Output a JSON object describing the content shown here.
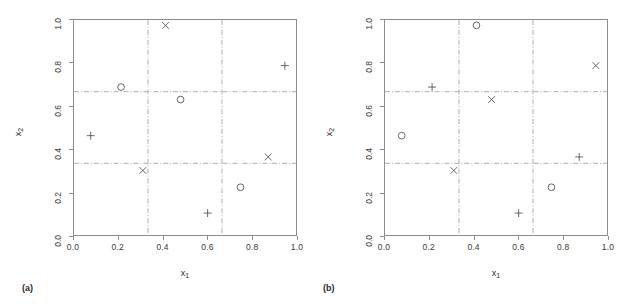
{
  "figure": {
    "background": "#ffffff",
    "axis_color": "#8d8d8d",
    "marker_color": "#555555",
    "grid_color": "#9a9a9a"
  },
  "chart_data": [
    {
      "type": "scatter",
      "panel": "(a)",
      "title": "",
      "xlabel": "x1",
      "ylabel": "x2",
      "xlim": [
        0,
        1
      ],
      "ylim": [
        0,
        1
      ],
      "xticks": [
        0.0,
        0.2,
        0.4,
        0.6,
        0.8,
        1.0
      ],
      "yticks": [
        0.0,
        0.2,
        0.4,
        0.6,
        0.8,
        1.0
      ],
      "xticklabels": [
        "0.0",
        "0.2",
        "0.4",
        "0.6",
        "0.8",
        "1.0"
      ],
      "yticklabels": [
        "0.0",
        "0.2",
        "0.4",
        "0.6",
        "0.8",
        "1.0"
      ],
      "grid": true,
      "gridlines_x": [
        0.3333,
        0.6667
      ],
      "gridlines_y": [
        0.3333,
        0.6667
      ],
      "gridline_style": "dashdot",
      "legend": "none",
      "points": [
        {
          "x": 0.075,
          "y": 0.462,
          "marker": "plus"
        },
        {
          "x": 0.212,
          "y": 0.688,
          "marker": "circle"
        },
        {
          "x": 0.31,
          "y": 0.3,
          "marker": "cross"
        },
        {
          "x": 0.412,
          "y": 0.975,
          "marker": "cross"
        },
        {
          "x": 0.48,
          "y": 0.63,
          "marker": "circle"
        },
        {
          "x": 0.602,
          "y": 0.102,
          "marker": "plus"
        },
        {
          "x": 0.75,
          "y": 0.222,
          "marker": "circle"
        },
        {
          "x": 0.875,
          "y": 0.363,
          "marker": "cross"
        },
        {
          "x": 0.95,
          "y": 0.788,
          "marker": "plus"
        }
      ]
    },
    {
      "type": "scatter",
      "panel": "(b)",
      "title": "",
      "xlabel": "x1",
      "ylabel": "x2",
      "xlim": [
        0,
        1
      ],
      "ylim": [
        0,
        1
      ],
      "xticks": [
        0.0,
        0.2,
        0.4,
        0.6,
        0.8,
        1.0
      ],
      "yticks": [
        0.0,
        0.2,
        0.4,
        0.6,
        0.8,
        1.0
      ],
      "xticklabels": [
        "0.0",
        "0.2",
        "0.4",
        "0.6",
        "0.8",
        "1.0"
      ],
      "yticklabels": [
        "0.0",
        "0.2",
        "0.4",
        "0.6",
        "0.8",
        "1.0"
      ],
      "grid": true,
      "gridlines_x": [
        0.3333,
        0.6667
      ],
      "gridlines_y": [
        0.3333,
        0.6667
      ],
      "gridline_style": "dashdot",
      "legend": "none",
      "points": [
        {
          "x": 0.075,
          "y": 0.462,
          "marker": "circle"
        },
        {
          "x": 0.212,
          "y": 0.688,
          "marker": "plus"
        },
        {
          "x": 0.31,
          "y": 0.3,
          "marker": "cross"
        },
        {
          "x": 0.412,
          "y": 0.975,
          "marker": "circle"
        },
        {
          "x": 0.48,
          "y": 0.63,
          "marker": "cross"
        },
        {
          "x": 0.602,
          "y": 0.102,
          "marker": "plus"
        },
        {
          "x": 0.75,
          "y": 0.222,
          "marker": "circle"
        },
        {
          "x": 0.875,
          "y": 0.363,
          "marker": "plus"
        },
        {
          "x": 0.95,
          "y": 0.788,
          "marker": "cross"
        }
      ]
    }
  ],
  "panels": [
    {
      "caption": "(a)",
      "xlabel_main": "x",
      "xlabel_sub": "1",
      "ylabel_main": "x",
      "ylabel_sub": "2"
    },
    {
      "caption": "(b)",
      "xlabel_main": "x",
      "xlabel_sub": "1",
      "ylabel_main": "x",
      "ylabel_sub": "2"
    }
  ]
}
